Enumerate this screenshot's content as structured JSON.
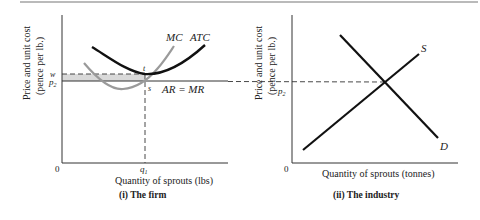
{
  "panels": [
    {
      "id": "firm",
      "caption": "(i)  The firm",
      "ylabel_line1": "Price and unit cost",
      "ylabel_line2": "(pence per lb.)",
      "xlabel": "Quantity of sprouts (lbs)",
      "origin": "0",
      "ticks": {
        "w": "w",
        "p2": "p",
        "p2_sub": "2",
        "q1": "q",
        "q1_sub": "1"
      },
      "curve_labels": {
        "mc": "MC",
        "atc": "ATC",
        "ar_mr": "AR = MR"
      },
      "point_labels": {
        "t": "t",
        "s": "s"
      }
    },
    {
      "id": "industry",
      "caption": "(ii)  The industry",
      "ylabel_line1": "Price and unit cost",
      "ylabel_line2": "(pence per lb.)",
      "xlabel": "Quantity of sprouts (tonnes)",
      "origin": "0",
      "ticks": {
        "p2": "p",
        "p2_sub": "2"
      },
      "curve_labels": {
        "s": "S",
        "d": "D"
      }
    }
  ],
  "colors": {
    "ink": "#111111",
    "mc_gray": "#9a9a9a",
    "loss_area": "#d9d9d9",
    "rule": "#777777"
  }
}
